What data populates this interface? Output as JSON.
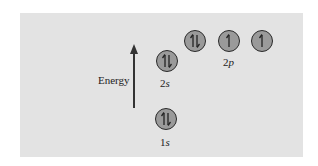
{
  "diagram": {
    "axis_label": "Energy",
    "colors": {
      "panel": "#e3e3e3",
      "orbital_fill": "#9a9a9a",
      "outline": "#2a2a2a",
      "text": "#222222"
    },
    "orbitals": [
      {
        "id": "1s",
        "principal": "1",
        "subshell": "s",
        "electrons": 2,
        "spins": [
          "up",
          "down"
        ]
      },
      {
        "id": "2s",
        "principal": "2",
        "subshell": "s",
        "electrons": 2,
        "spins": [
          "up",
          "down"
        ]
      },
      {
        "id": "2p-1",
        "principal": "2",
        "subshell": "p",
        "electrons": 2,
        "spins": [
          "up",
          "down"
        ]
      },
      {
        "id": "2p-2",
        "principal": "2",
        "subshell": "p",
        "electrons": 1,
        "spins": [
          "up"
        ]
      },
      {
        "id": "2p-3",
        "principal": "2",
        "subshell": "p",
        "electrons": 1,
        "spins": [
          "up"
        ]
      }
    ],
    "labels": {
      "l1s": {
        "n": "1",
        "sub": "s"
      },
      "l2s": {
        "n": "2",
        "sub": "s"
      },
      "l2p": {
        "n": "2",
        "sub": "p"
      }
    }
  }
}
